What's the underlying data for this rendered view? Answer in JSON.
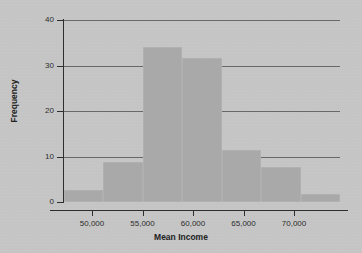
{
  "chart_data": {
    "type": "bar",
    "title": "",
    "subtitle": "",
    "xlabel": "Mean Income",
    "ylabel": "Frequency",
    "grid": true,
    "legend": null,
    "xlim": [
      46800,
      74800
    ],
    "ylim": [
      0,
      40
    ],
    "x_ticks": [
      {
        "value": 50000,
        "label": "50,000"
      },
      {
        "value": 55000,
        "label": "55,000"
      },
      {
        "value": 60000,
        "label": "60,000"
      },
      {
        "value": 65000,
        "label": "65,000"
      },
      {
        "value": 70000,
        "label": "70,000"
      }
    ],
    "y_ticks": [
      {
        "value": 0,
        "label": "0"
      },
      {
        "value": 10,
        "label": "10"
      },
      {
        "value": 20,
        "label": "20"
      },
      {
        "value": 30,
        "label": "30"
      },
      {
        "value": 40,
        "label": "40"
      }
    ],
    "bin_width": 4000,
    "bars": [
      {
        "bin_start": 46800,
        "bin_end": 50800,
        "value": 2.7
      },
      {
        "bin_start": 50800,
        "bin_end": 54800,
        "value": 8.9
      },
      {
        "bin_start": 54800,
        "bin_end": 58800,
        "value": 34.0
      },
      {
        "bin_start": 58800,
        "bin_end": 62800,
        "value": 31.7
      },
      {
        "bin_start": 62800,
        "bin_end": 66800,
        "value": 11.5
      },
      {
        "bin_start": 66800,
        "bin_end": 70800,
        "value": 7.8
      },
      {
        "bin_start": 70800,
        "bin_end": 74800,
        "value": 1.8
      }
    ],
    "categories": [
      "46,800-50,800",
      "50,800-54,800",
      "54,800-58,800",
      "58,800-62,800",
      "62,800-66,800",
      "66,800-70,800",
      "70,800-74,800"
    ],
    "values": [
      2.7,
      8.9,
      34.0,
      31.7,
      11.5,
      7.8,
      1.8
    ],
    "colors": {
      "background": "#c9c9c9",
      "bar_fill": "#a9a9a9",
      "gridline": "#4a4a4a",
      "axis": "#2e2e2e",
      "text": "#2b2b2b"
    }
  }
}
